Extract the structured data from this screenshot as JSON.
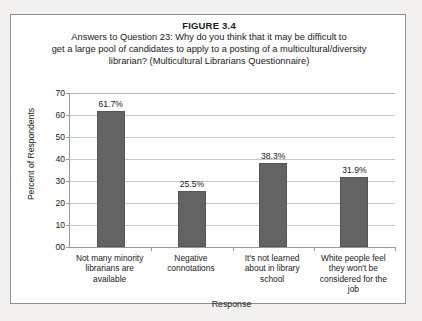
{
  "figure": {
    "number_label": "FIGURE 3.4",
    "title_lines": [
      "Answers to Question 23: Why do you think that it may be difficult to",
      "get a large pool of candidates to apply to a posting of a multicultural/diversity",
      "librarian? (Multicultural Librarians Questionnaire)"
    ]
  },
  "colors": {
    "bar_fill": "#636363",
    "bar_edge": "#555555",
    "gridline": "#c8c8c8",
    "axis": "#9a9a9a",
    "frame": "#8d8d8d",
    "text": "#1a1a1a",
    "page_background": "#f2f1ef",
    "plot_background": "#ffffff"
  },
  "chart_data": {
    "type": "bar",
    "xlabel": "Response",
    "ylabel": "Percent of Respondents",
    "ylim": [
      0,
      70
    ],
    "ytick_values": [
      0,
      10,
      20,
      30,
      40,
      50,
      60,
      70
    ],
    "ytick_labels": [
      "00",
      "10",
      "20",
      "30",
      "40",
      "50",
      "60",
      "70"
    ],
    "grid": true,
    "legend": false,
    "categories": [
      "Not many minority librarians are available",
      "Negative connotations",
      "It's not learned about in library school",
      "White people feel they won't be considered for the job"
    ],
    "category_label_lines": [
      [
        "Not many minority",
        "librarians are",
        "available"
      ],
      [
        "Negative",
        "connotations"
      ],
      [
        "It's not learned",
        "about in library",
        "school"
      ],
      [
        "White people feel",
        "they won't be",
        "considered for the",
        "job"
      ]
    ],
    "values": [
      61.7,
      25.5,
      38.3,
      31.9
    ],
    "data_labels": [
      "61.7%",
      "25.5%",
      "38.3%",
      "31.9%"
    ]
  }
}
